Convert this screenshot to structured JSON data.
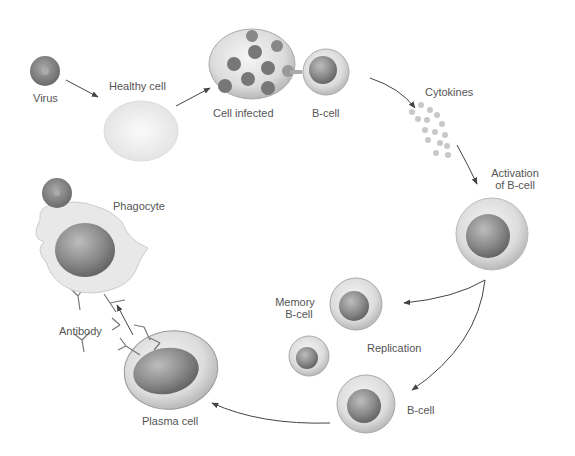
{
  "labels": {
    "virus": "Virus",
    "healthy_cell": "Healthy cell",
    "cell_infected": "Cell infected",
    "b_cell_top": "B-cell",
    "cytokines": "Cytokines",
    "activation_line1": "Activation",
    "activation_line2": "of B-cell",
    "memory_line1": "Memory",
    "memory_line2": "B-cell",
    "replication": "Replication",
    "b_cell_bottom": "B-cell",
    "plasma_cell": "Plasma cell",
    "antibody": "Antibody",
    "phagocyte": "Phagocyte"
  },
  "colors": {
    "arrow": "#444444",
    "label": "#555555",
    "cell_outer": "#e6e6e6",
    "nucleus": "#8a8a8a",
    "virus": "#7d7d7d"
  }
}
